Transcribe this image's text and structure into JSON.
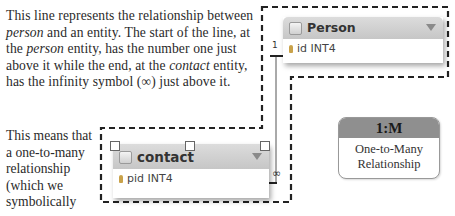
{
  "paragraph1": {
    "segments": [
      "This line represents the relationship between ",
      "person",
      " and an entity. The start of the line, at the ",
      "person",
      " entity, has the number one just above it while the end, at the ",
      "contact",
      " entity, has the infinity symbol (∞) just above it."
    ]
  },
  "paragraph2": {
    "text": "This means that a one-to-many relationship (which we symbolically"
  },
  "diagram": {
    "person_entity": {
      "title": "Person",
      "field": "id INT4"
    },
    "contact_entity": {
      "title": "contact",
      "field": "pid INT4"
    },
    "cardinality_start": "1",
    "cardinality_end": "∞"
  },
  "badge": {
    "title": "1:M",
    "line1": "One-to-Many",
    "line2": "Relationship"
  },
  "colors": {
    "header_gray": "#c6c6c6",
    "badge_header": "#8f8f8f",
    "dash": "#222222"
  }
}
